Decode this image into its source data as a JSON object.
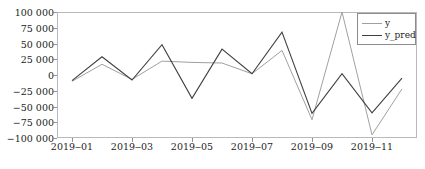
{
  "chart_data": {
    "type": "line",
    "title": "",
    "xlabel": "",
    "ylabel": "",
    "x": [
      "2019-01",
      "2019-02",
      "2019-03",
      "2019-04",
      "2019-05",
      "2019-06",
      "2019-07",
      "2019-08",
      "2019-09",
      "2019-10",
      "2019-11",
      "2019-12"
    ],
    "series": [
      {
        "name": "y",
        "color": "#a0a0a0",
        "values": [
          -10000,
          17000,
          -7000,
          22000,
          20000,
          19000,
          2000,
          39000,
          -71000,
          100000,
          -95000,
          -22000
        ]
      },
      {
        "name": "y_pred",
        "color": "#404040",
        "values": [
          -9000,
          29000,
          -8000,
          48000,
          -37000,
          41000,
          2000,
          68000,
          -61000,
          2000,
          -60000,
          -5000
        ]
      }
    ],
    "ylim": [
      -100000,
      100000
    ],
    "yticks": [
      100000,
      75000,
      50000,
      25000,
      0,
      -25000,
      -50000,
      -75000,
      -100000
    ],
    "ytick_labels": [
      "100 000",
      "75 000",
      "50 000",
      "25 000",
      "0",
      "−25 000",
      "−50 000",
      "−75 000",
      "−100 000"
    ],
    "xticks": [
      "2019-01",
      "2019-03",
      "2019-05",
      "2019-07",
      "2019-09",
      "2019-11"
    ],
    "xtick_labels": [
      "2019‒01",
      "2019‒03",
      "2019‒05",
      "2019‒07",
      "2019‒09",
      "2019‒11"
    ],
    "grid": false,
    "legend_position": "upper right",
    "legend_entries": [
      "y",
      "y_pred"
    ]
  }
}
